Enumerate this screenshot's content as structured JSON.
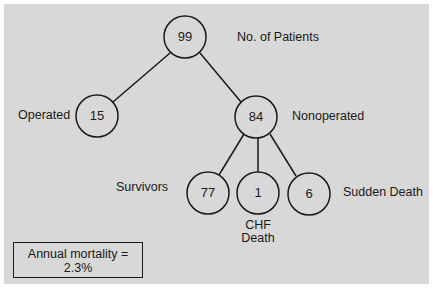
{
  "diagram": {
    "type": "tree",
    "colors": {
      "background": "#d8d8d8",
      "stroke": "#1a1a1a"
    },
    "nodes": {
      "root": {
        "value": "99",
        "label": "No. of Patients"
      },
      "operated": {
        "value": "15",
        "label": "Operated"
      },
      "nonoperated": {
        "value": "84",
        "label": "Nonoperated"
      },
      "survivors": {
        "value": "77",
        "label": "Survivors"
      },
      "chf_death": {
        "value": "1",
        "label_line1": "CHF",
        "label_line2": "Death"
      },
      "sudden_death": {
        "value": "6",
        "label": "Sudden Death"
      }
    },
    "edges": [
      [
        "root",
        "operated"
      ],
      [
        "root",
        "nonoperated"
      ],
      [
        "nonoperated",
        "survivors"
      ],
      [
        "nonoperated",
        "chf_death"
      ],
      [
        "nonoperated",
        "sudden_death"
      ]
    ],
    "summary": {
      "line1": "Annual mortality =",
      "line2": "2.3%"
    }
  }
}
